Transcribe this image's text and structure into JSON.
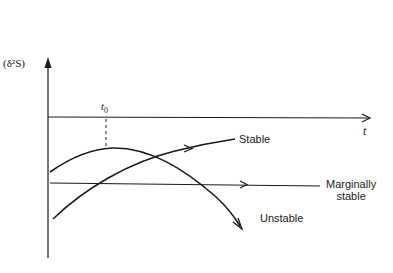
{
  "diagram": {
    "title": "",
    "y_axis_label": "(δ²S)",
    "x_axis_label": "t",
    "reference_time": {
      "label_base": "t",
      "label_sub": "0"
    },
    "curves": [
      {
        "name": "stable",
        "label": "Stable",
        "description": "rising curve crossing the marginal line"
      },
      {
        "name": "unstable",
        "label": "Unstable",
        "description": "curve peaking at t0 then decreasing"
      },
      {
        "name": "marginally-stable",
        "label_line1": "Marginally",
        "label_line2": "stable",
        "description": "horizontal line"
      }
    ],
    "colors": {
      "stroke": "#1a1a1a",
      "background": "#ffffff"
    }
  }
}
